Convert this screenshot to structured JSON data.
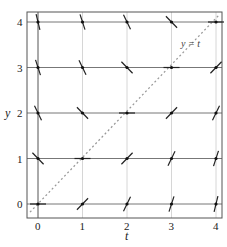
{
  "diagram": {
    "type": "slope-field",
    "equation_note": "slopes follow dy/dt = t - y",
    "xlabel": "t",
    "ylabel": "y",
    "x_ticks": [
      "0",
      "1",
      "2",
      "3",
      "4"
    ],
    "y_ticks": [
      "0",
      "1",
      "2",
      "3",
      "4"
    ],
    "annotation": "y = t",
    "xlim": [
      0,
      4
    ],
    "ylim": [
      0,
      4
    ],
    "grid": true,
    "colors": {
      "frame": "#555555",
      "major_grid": "#666666",
      "minor_grid": "#cccccc",
      "segment": "#222222",
      "dashed_line": "#999999"
    }
  }
}
